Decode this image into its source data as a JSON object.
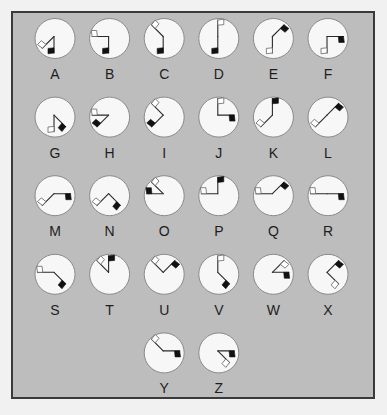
{
  "colors": {
    "panel_bg": "#bdbdbd",
    "panel_border": "#3a3a3a",
    "circle_fill": "#f7f7f7",
    "circle_stroke": "#8a8a8a",
    "arm": "#2a2a2a",
    "black_flag": "#111111",
    "white_flag_fill": "#ffffff",
    "white_flag_stroke": "#666666"
  },
  "letters": [
    {
      "label": "A",
      "black_flag": "S",
      "white_flag": "SW"
    },
    {
      "label": "B",
      "black_flag": "S",
      "white_flag": "W"
    },
    {
      "label": "C",
      "black_flag": "S",
      "white_flag": "NW"
    },
    {
      "label": "D",
      "black_flag": "S",
      "white_flag": "N"
    },
    {
      "label": "E",
      "black_flag": "NE",
      "white_flag": "S"
    },
    {
      "label": "F",
      "black_flag": "E",
      "white_flag": "S"
    },
    {
      "label": "G",
      "black_flag": "SE",
      "white_flag": "S"
    },
    {
      "label": "H",
      "black_flag": "SW",
      "white_flag": "W"
    },
    {
      "label": "I",
      "black_flag": "SW",
      "white_flag": "NW"
    },
    {
      "label": "J",
      "black_flag": "E",
      "white_flag": "N"
    },
    {
      "label": "K",
      "black_flag": "N",
      "white_flag": "SW"
    },
    {
      "label": "L",
      "black_flag": "NE",
      "white_flag": "SW"
    },
    {
      "label": "M",
      "black_flag": "E",
      "white_flag": "SW"
    },
    {
      "label": "N",
      "black_flag": "SE",
      "white_flag": "SW"
    },
    {
      "label": "O",
      "black_flag": "W",
      "white_flag": "NW"
    },
    {
      "label": "P",
      "black_flag": "N",
      "white_flag": "W"
    },
    {
      "label": "Q",
      "black_flag": "NE",
      "white_flag": "W"
    },
    {
      "label": "R",
      "black_flag": "E",
      "white_flag": "W"
    },
    {
      "label": "S",
      "black_flag": "SE",
      "white_flag": "W"
    },
    {
      "label": "T",
      "black_flag": "N",
      "white_flag": "NW"
    },
    {
      "label": "U",
      "black_flag": "NE",
      "white_flag": "NW"
    },
    {
      "label": "V",
      "black_flag": "SE",
      "white_flag": "N"
    },
    {
      "label": "W",
      "black_flag": "E",
      "white_flag": "NE"
    },
    {
      "label": "X",
      "black_flag": "NE",
      "white_flag": "SE"
    },
    {
      "label": "Y",
      "black_flag": "E",
      "white_flag": "NW"
    },
    {
      "label": "Z",
      "black_flag": "E",
      "white_flag": "SE"
    }
  ]
}
